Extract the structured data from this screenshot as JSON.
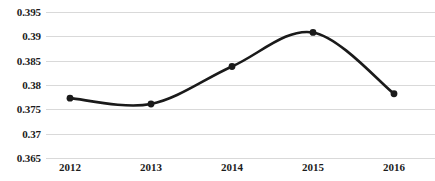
{
  "chart_data": {
    "type": "line",
    "title": "",
    "subtitle": "",
    "xlabel": "",
    "ylabel": "",
    "categories": [
      "2012",
      "2013",
      "2014",
      "2015",
      "2016"
    ],
    "values": [
      0.3773,
      0.3761,
      0.3838,
      0.3908,
      0.3782
    ],
    "series": [
      {
        "name": "",
        "values": [
          0.3773,
          0.3761,
          0.3838,
          0.3908,
          0.3782
        ]
      }
    ],
    "ylim": [
      0.365,
      0.395
    ],
    "y_ticks": [
      0.395,
      0.39,
      0.385,
      0.38,
      0.375,
      0.37,
      0.365
    ],
    "y_tick_labels": [
      "0.395",
      "0.39",
      "0.385",
      "0.38",
      "0.375",
      "0.37",
      "0.365"
    ],
    "x_tick_labels": [
      "2012",
      "2013",
      "2014",
      "2015",
      "2016"
    ],
    "grid": true,
    "grid_color": "#d9d9d9",
    "legend": false,
    "legend_position": "none",
    "smooth": true,
    "markers": true,
    "line_color": "#1a1a1a",
    "marker_color": "#1a1a1a",
    "background_color": "#ffffff",
    "annotations": []
  }
}
